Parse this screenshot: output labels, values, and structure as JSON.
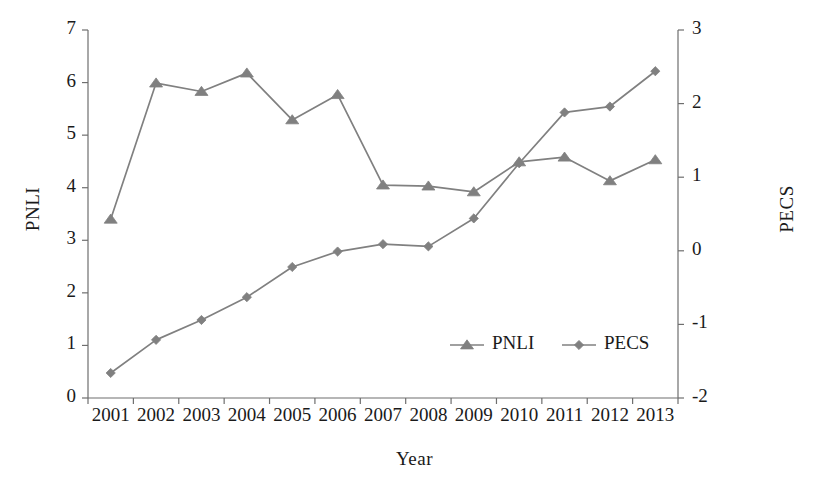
{
  "chart_data": {
    "type": "line",
    "title": "",
    "xlabel": "Year",
    "ylabel": "PNLI",
    "y2label": "PECS",
    "categories": [
      "2001",
      "2002",
      "2003",
      "2004",
      "2005",
      "2006",
      "2007",
      "2008",
      "2009",
      "2010",
      "2011",
      "2012",
      "2013"
    ],
    "ylim": [
      0,
      7
    ],
    "y2lim": [
      -2,
      3
    ],
    "yticks": [
      0,
      1,
      2,
      3,
      4,
      5,
      6,
      7
    ],
    "y2ticks": [
      -2,
      -1,
      0,
      1,
      2,
      3
    ],
    "ytick_labels": [
      "0",
      "1",
      "2",
      "3",
      "4",
      "5",
      "6",
      "7"
    ],
    "y2tick_labels": [
      "-2",
      "-1",
      "0",
      "1",
      "2",
      "3"
    ],
    "grid": false,
    "legend_position": "inside-lower-right",
    "series": [
      {
        "name": "PNLI",
        "axis": "left",
        "marker": "triangle",
        "color": "#808080",
        "values": [
          3.4,
          5.99,
          5.83,
          6.18,
          5.29,
          5.77,
          4.05,
          4.03,
          3.92,
          4.49,
          4.58,
          4.13,
          4.53
        ]
      },
      {
        "name": "PECS",
        "axis": "right",
        "marker": "diamond",
        "color": "#808080",
        "values": [
          -1.66,
          -1.21,
          -0.94,
          -0.63,
          -0.22,
          -0.01,
          0.09,
          0.06,
          0.44,
          1.19,
          1.88,
          1.96,
          2.44
        ]
      }
    ]
  },
  "legend": {
    "items": [
      {
        "label": "PNLI",
        "marker": "triangle",
        "color": "#808080"
      },
      {
        "label": "PECS",
        "marker": "diamond",
        "color": "#808080"
      }
    ]
  },
  "style": {
    "line_color": "#808080",
    "axis_color": "#6e6e6e",
    "text_color": "#1a1a1a",
    "background": "#ffffff"
  }
}
